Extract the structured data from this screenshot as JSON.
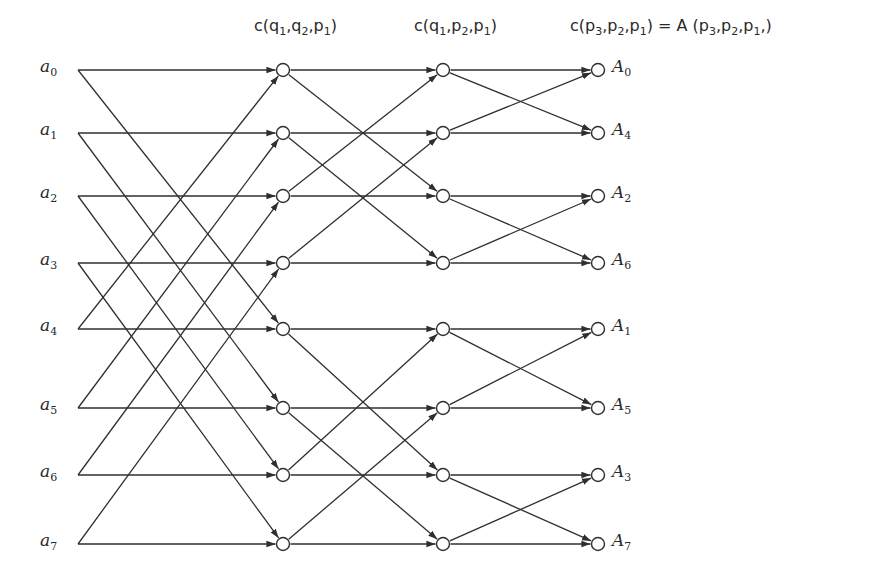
{
  "figure": {
    "type": "fft-butterfly-signal-flow-graph",
    "points": 8,
    "stages": 3
  },
  "headers": [
    {
      "text": "c(q",
      "full": "c(q1,q2,p1)",
      "x": 254,
      "y": 36
    },
    {
      "text": "c(q1,p2,p1)",
      "full": "c(q1,p2,p1)",
      "x": 414,
      "y": 36
    },
    {
      "text": "c(p3,p2,p1) = A(p3,p2,p1,)",
      "full": "c(p3,p2,p1) = A (p3,p2,p1,)",
      "x": 570,
      "y": 36
    }
  ],
  "header_parts": [
    [
      [
        "c(q",
        ""
      ],
      [
        "1",
        "s"
      ],
      [
        ",q",
        ""
      ],
      [
        "2",
        "s"
      ],
      [
        ",p",
        ""
      ],
      [
        "1",
        "s"
      ],
      [
        ")",
        ""
      ]
    ],
    [
      [
        "c(q",
        ""
      ],
      [
        "1",
        "s"
      ],
      [
        ",p",
        ""
      ],
      [
        "2",
        "s"
      ],
      [
        ",p",
        ""
      ],
      [
        "1",
        "s"
      ],
      [
        ")",
        ""
      ]
    ],
    [
      [
        "c(p",
        ""
      ],
      [
        "3",
        "s"
      ],
      [
        ",p",
        ""
      ],
      [
        "2",
        "s"
      ],
      [
        ",p",
        ""
      ],
      [
        "1",
        "s"
      ],
      [
        ") = A (p",
        ""
      ],
      [
        "3",
        "s"
      ],
      [
        ",p",
        ""
      ],
      [
        "2",
        "s"
      ],
      [
        ",p",
        ""
      ],
      [
        "1",
        "s"
      ],
      [
        ",)",
        ""
      ]
    ]
  ],
  "inputs": [
    {
      "base": "a",
      "sub": "0",
      "y": 70
    },
    {
      "base": "a",
      "sub": "1",
      "y": 133
    },
    {
      "base": "a",
      "sub": "2",
      "y": 196
    },
    {
      "base": "a",
      "sub": "3",
      "y": 263
    },
    {
      "base": "a",
      "sub": "4",
      "y": 329
    },
    {
      "base": "a",
      "sub": "5",
      "y": 408
    },
    {
      "base": "a",
      "sub": "6",
      "y": 475
    },
    {
      "base": "a",
      "sub": "7",
      "y": 544
    }
  ],
  "outputs": [
    {
      "base": "A",
      "sub": "0"
    },
    {
      "base": "A",
      "sub": "4"
    },
    {
      "base": "A",
      "sub": "2"
    },
    {
      "base": "A",
      "sub": "6"
    },
    {
      "base": "A",
      "sub": "1"
    },
    {
      "base": "A",
      "sub": "5"
    },
    {
      "base": "A",
      "sub": "3"
    },
    {
      "base": "A",
      "sub": "7"
    }
  ],
  "layout": {
    "input_x": 78,
    "stage_x": [
      283,
      443,
      598
    ],
    "node_radius": 6.5,
    "stage_spans": [
      4,
      2,
      1
    ],
    "line_color": "#2f2f2f",
    "node_color": "#2f2f2f"
  }
}
